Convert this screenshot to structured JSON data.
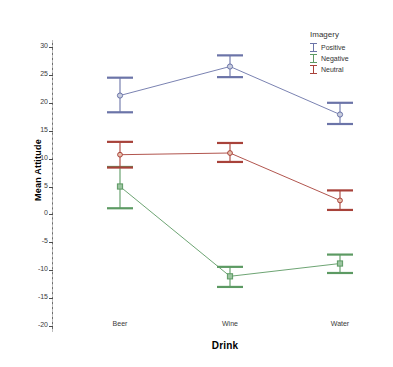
{
  "chart_data": {
    "type": "line",
    "title": "",
    "xlabel": "Drink",
    "ylabel": "Mean Attitude",
    "categories": [
      "Beer",
      "Wine",
      "Water"
    ],
    "ylim": [
      -20,
      30
    ],
    "yticks": [
      30,
      25,
      20,
      15,
      10,
      5,
      0,
      -5,
      -10,
      -15,
      -20
    ],
    "ytick_labels": [
      "30",
      "25",
      "20",
      "15",
      "10",
      "5",
      "0",
      "-5",
      "-10",
      "-15",
      "-20"
    ],
    "grid": "vertical-dashed",
    "errorbars": "95% CI",
    "legend": {
      "title": "Imagery",
      "position": "top-right",
      "entries": [
        "Positive",
        "Negative",
        "Neutral"
      ]
    },
    "series": [
      {
        "name": "Positive",
        "color": "#6b74a8",
        "values": [
          21.3,
          26.5,
          17.9
        ],
        "err_low": [
          18.3,
          24.6,
          16.2
        ],
        "err_high": [
          24.5,
          28.5,
          20.0
        ]
      },
      {
        "name": "Negative",
        "color": "#5c9a63",
        "values": [
          5.0,
          -11.1,
          -8.8
        ],
        "err_low": [
          1.1,
          -13.0,
          -10.5
        ],
        "err_high": [
          8.5,
          -9.4,
          -7.2
        ]
      },
      {
        "name": "Neutral",
        "color": "#a8423a",
        "values": [
          10.7,
          11.0,
          2.5
        ],
        "err_low": [
          8.4,
          9.4,
          0.8
        ],
        "err_high": [
          13.0,
          12.8,
          4.3
        ]
      }
    ]
  },
  "colors": {
    "positive": "#6b74a8",
    "negative": "#5c9a63",
    "neutral": "#a8423a",
    "axis": "#6a6a6a",
    "grid": "#bdbdbd",
    "text": "#333333",
    "background": "#ffffff"
  }
}
